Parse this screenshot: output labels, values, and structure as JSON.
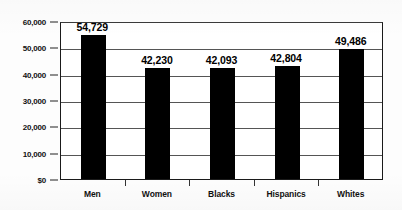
{
  "chart_data": {
    "type": "bar",
    "title": "",
    "subtitle": "",
    "xlabel": "",
    "ylabel": "",
    "categories": [
      "Men",
      "Women",
      "Blacks",
      "Hispanics",
      "Whites"
    ],
    "values": [
      54729,
      42230,
      42093,
      42804,
      49486
    ],
    "value_labels": [
      "54,729",
      "42,230",
      "42,093",
      "42,804",
      "49,486"
    ],
    "ylim": [
      0,
      60000
    ],
    "ytick_values": [
      0,
      10000,
      20000,
      30000,
      40000,
      50000,
      60000
    ],
    "ytick_labels": [
      "$0",
      "10,000",
      "20,000",
      "30,000",
      "40,000",
      "50,000",
      "60,000"
    ],
    "grid": true,
    "legend": false,
    "legend_position": "none",
    "bar_color": "#000000",
    "axis_color": "#1a1a1a",
    "grid_color": "#555555",
    "background_color": "#ffffff"
  }
}
